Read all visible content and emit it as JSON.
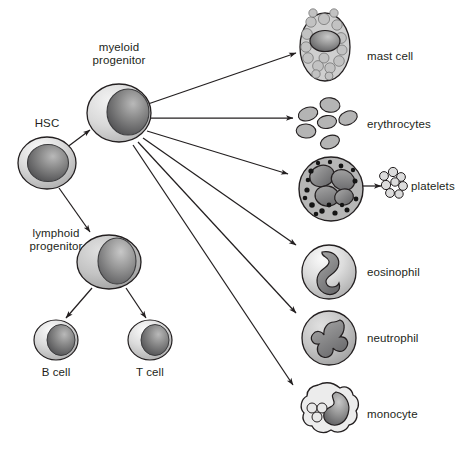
{
  "diagram": {
    "background_color": "#ffffff",
    "line_color": "#231f20",
    "text_color": "#231f20",
    "palette": {
      "cytoplasm_light": "#d8d8d8",
      "cytoplasm_mid": "#bdbdbd",
      "nucleus_dark": "#6f6f6f",
      "nucleus_darker": "#58585a",
      "granule_dark": "#1a1a1a",
      "outline": "#231f20"
    }
  },
  "nodes": [
    {
      "id": "hsc",
      "label": "HSC",
      "type": "stem-cell",
      "cx": 47,
      "cy": 163,
      "label_x": 47,
      "label_y": 124,
      "label_align": "center"
    },
    {
      "id": "myeloid-progenitor",
      "label": "myeloid\nprogenitor",
      "label_line1": "myeloid",
      "label_line2": "progenitor",
      "type": "progenitor",
      "cx": 119,
      "cy": 113,
      "label_x": 119,
      "label_y": 48,
      "label_align": "center"
    },
    {
      "id": "lymphoid-progenitor",
      "label": "lymphoid\nprogenitor",
      "label_line1": "lymphoid",
      "label_line2": "progenitor",
      "type": "progenitor",
      "cx": 109,
      "cy": 262,
      "label_x": 56,
      "label_y": 234,
      "label_align": "center"
    },
    {
      "id": "b-cell",
      "label": "B cell",
      "type": "lymphocyte",
      "cx": 56,
      "cy": 340,
      "label_x": 56,
      "label_y": 366,
      "label_align": "center"
    },
    {
      "id": "t-cell",
      "label": "T cell",
      "type": "lymphocyte",
      "cx": 150,
      "cy": 340,
      "label_x": 150,
      "label_y": 366,
      "label_align": "center"
    },
    {
      "id": "mast-cell",
      "label": "mast cell",
      "type": "mast-cell",
      "cx": 325,
      "cy": 47,
      "label_x": 367,
      "label_y": 50,
      "label_align": "left"
    },
    {
      "id": "erythrocytes",
      "label": "erythrocytes",
      "type": "erythrocytes",
      "cx": 328,
      "cy": 122,
      "label_x": 367,
      "label_y": 125,
      "label_align": "left"
    },
    {
      "id": "megakaryocyte",
      "label": "",
      "type": "megakaryocyte",
      "cx": 331,
      "cy": 189,
      "label_x": 0,
      "label_y": 0,
      "label_align": "left"
    },
    {
      "id": "platelets",
      "label": "platelets",
      "type": "platelets",
      "cx": 392,
      "cy": 184,
      "label_x": 413,
      "label_y": 186,
      "label_align": "left"
    },
    {
      "id": "eosinophil",
      "label": "eosinophil",
      "type": "eosinophil",
      "cx": 329,
      "cy": 272,
      "label_x": 367,
      "label_y": 272,
      "label_align": "left"
    },
    {
      "id": "neutrophil",
      "label": "neutrophil",
      "type": "neutrophil",
      "cx": 329,
      "cy": 338,
      "label_x": 367,
      "label_y": 338,
      "label_align": "left"
    },
    {
      "id": "monocyte",
      "label": "monocyte",
      "type": "monocyte",
      "cx": 329,
      "cy": 414,
      "label_x": 367,
      "label_y": 414,
      "label_align": "left"
    }
  ],
  "arrows": [
    {
      "id": "hsc-to-myeloid",
      "from": "hsc",
      "to": "myeloid-progenitor",
      "x1": 66,
      "y1": 148,
      "x2": 90,
      "y2": 130
    },
    {
      "id": "hsc-to-lymphoid",
      "from": "hsc",
      "to": "lymphoid-progenitor",
      "x1": 59,
      "y1": 188,
      "x2": 90,
      "y2": 232
    },
    {
      "id": "lymphoid-to-bcell",
      "from": "lymphoid-progenitor",
      "to": "b-cell",
      "x1": 92,
      "y1": 288,
      "x2": 66,
      "y2": 318
    },
    {
      "id": "lymphoid-to-tcell",
      "from": "lymphoid-progenitor",
      "to": "t-cell",
      "x1": 126,
      "y1": 288,
      "x2": 146,
      "y2": 318
    },
    {
      "id": "myeloid-to-mast",
      "from": "myeloid-progenitor",
      "to": "mast-cell",
      "x1": 148,
      "y1": 104,
      "x2": 296,
      "y2": 53
    },
    {
      "id": "myeloid-to-erythro",
      "from": "myeloid-progenitor",
      "to": "erythrocytes",
      "x1": 150,
      "y1": 118,
      "x2": 293,
      "y2": 118
    },
    {
      "id": "myeloid-to-megakaryo",
      "from": "myeloid-progenitor",
      "to": "megakaryocyte",
      "x1": 147,
      "y1": 131,
      "x2": 288,
      "y2": 174
    },
    {
      "id": "myeloid-to-eosinophil",
      "from": "myeloid-progenitor",
      "to": "eosinophil",
      "x1": 143,
      "y1": 138,
      "x2": 296,
      "y2": 245
    },
    {
      "id": "myeloid-to-neutrophil",
      "from": "myeloid-progenitor",
      "to": "neutrophil",
      "x1": 138,
      "y1": 142,
      "x2": 296,
      "y2": 313
    },
    {
      "id": "myeloid-to-monocyte",
      "from": "myeloid-progenitor",
      "to": "monocyte",
      "x1": 133,
      "y1": 145,
      "x2": 293,
      "y2": 385
    },
    {
      "id": "megakaryo-to-platelets",
      "from": "megakaryocyte",
      "to": "platelets",
      "x1": 359,
      "y1": 186,
      "x2": 379,
      "y2": 186
    }
  ]
}
